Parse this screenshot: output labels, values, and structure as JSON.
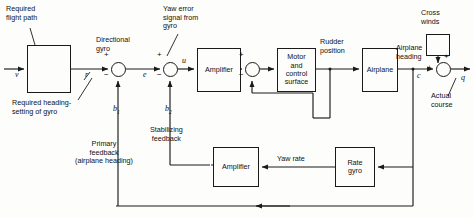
{
  "diagram": {
    "blocks": [
      {
        "id": "gyro_setting",
        "label": "",
        "x": 27,
        "y": 45,
        "w": 44,
        "h": 48
      },
      {
        "id": "amplifier_fwd",
        "label": "Amplifier",
        "x": 197,
        "y": 48,
        "w": 44,
        "h": 44
      },
      {
        "id": "motor_control_surface",
        "label": "Motor\nand\ncontrol\nsurface",
        "x": 277,
        "y": 48,
        "w": 39,
        "h": 44
      },
      {
        "id": "airplane",
        "label": "Airplane",
        "x": 362,
        "y": 48,
        "w": 36,
        "h": 44
      },
      {
        "id": "cross_winds_block",
        "label": "",
        "x": 426,
        "y": 34,
        "w": 24,
        "h": 22
      },
      {
        "id": "amplifier_fb",
        "label": "Amplifier",
        "x": 213,
        "y": 147,
        "w": 46,
        "h": 40
      },
      {
        "id": "rate_gyro",
        "label": "Rate\ngyro",
        "x": 335,
        "y": 147,
        "w": 40,
        "h": 40
      }
    ],
    "summing_junctions": [
      {
        "id": "sum_heading",
        "cx": 118,
        "cy": 70,
        "r": 7.5,
        "signs": [
          "+",
          "-"
        ]
      },
      {
        "id": "sum_yaw_error",
        "cx": 170,
        "cy": 70,
        "r": 7.5,
        "signs": [
          "+",
          "-"
        ]
      },
      {
        "id": "sum_stabilizing",
        "cx": 252,
        "cy": 70,
        "r": 7.5,
        "signs": [
          "+",
          "-"
        ]
      },
      {
        "id": "sum_cross_winds",
        "cx": 443,
        "cy": 72,
        "r": 7.5,
        "signs": [
          "+",
          "+"
        ]
      }
    ],
    "signals": [
      {
        "id": "v",
        "text": "v",
        "x": 15,
        "y": 76
      },
      {
        "id": "r",
        "text": "r",
        "x": 84,
        "y": 76
      },
      {
        "id": "e",
        "text": "e",
        "x": 145,
        "y": 76
      },
      {
        "id": "u",
        "text": "u",
        "x": 182,
        "y": 64
      },
      {
        "id": "b1",
        "text": "b",
        "sub": "1",
        "x": 114,
        "y": 110
      },
      {
        "id": "b2",
        "text": "b",
        "sub": "2",
        "x": 166,
        "y": 110
      },
      {
        "id": "c",
        "text": "c",
        "x": 418,
        "y": 80
      },
      {
        "id": "q",
        "text": "q",
        "x": 461,
        "y": 82
      }
    ],
    "annotations": [
      {
        "id": "required_flight_path",
        "text": "Required\nflight path",
        "x": 6,
        "y": 6,
        "align": "left"
      },
      {
        "id": "required_heading_setting",
        "text": "Required heading-\nsetting of gyro",
        "x": 14,
        "y": 100,
        "align": "left"
      },
      {
        "id": "directional_gyro",
        "text": "Directional\ngyro",
        "x": 94,
        "y": 40,
        "align": "left"
      },
      {
        "id": "yaw_error_signal",
        "text": "Yaw error\nsignal from\ngyro",
        "x": 163,
        "y": 6,
        "align": "left"
      },
      {
        "id": "stabilizing_feedback",
        "text": "Stabilizing\nfeedback",
        "x": 150,
        "y": 130,
        "align": "left"
      },
      {
        "id": "primary_feedback",
        "text": "Primary\nfeedback\n(airplane heading)",
        "x": 82,
        "y": 142,
        "align": "left"
      },
      {
        "id": "rudder_position",
        "text": "Rudder\nposition",
        "x": 320,
        "y": 40,
        "align": "left"
      },
      {
        "id": "airplane_heading",
        "text": "Airplane\nheading",
        "x": 396,
        "y": 47,
        "align": "left"
      },
      {
        "id": "cross_winds",
        "text": "Cross\nwinds",
        "x": 421,
        "y": 10,
        "align": "left"
      },
      {
        "id": "actual_course",
        "text": "Actual\ncourse",
        "x": 432,
        "y": 93,
        "align": "left"
      },
      {
        "id": "yaw_rate",
        "text": "Yaw rate",
        "x": 277,
        "y": 156,
        "align": "left"
      }
    ],
    "signs_layout": [
      {
        "id": "sum_heading_plus",
        "text": "+",
        "x": 104,
        "y": 56
      },
      {
        "id": "sum_heading_minus",
        "text": "−",
        "x": 104,
        "y": 74
      },
      {
        "id": "sum_yaw_error_plus",
        "text": "+",
        "x": 157,
        "y": 56
      },
      {
        "id": "sum_yaw_error_minus",
        "text": "−",
        "x": 157,
        "y": 74
      },
      {
        "id": "sum_stabilizing_plus",
        "text": "+",
        "x": 239,
        "y": 56
      },
      {
        "id": "sum_stabilizing_minus",
        "text": "−",
        "x": 239,
        "y": 74
      },
      {
        "id": "sum_cross_winds_plus_top",
        "text": "+",
        "x": 448,
        "y": 56
      },
      {
        "id": "sum_cross_winds_plus_left",
        "text": "+",
        "x": 428,
        "y": 70
      }
    ],
    "colors": {
      "line": "#1a1a1a",
      "background": "#fdfdfb",
      "text": "#111111"
    }
  }
}
